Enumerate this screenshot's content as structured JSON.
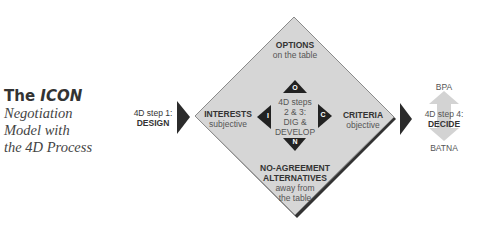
{
  "title": {
    "prefix": "The",
    "emphasis": "ICON",
    "subtitle_lines": [
      "Negotiation",
      "Model with",
      "the 4D Process"
    ]
  },
  "colors": {
    "diamond_fill": "#d6d6d6",
    "diamond_edge": "#8a8a8a",
    "diamond_shadow": "#333333",
    "arrow": "#2b2b2b",
    "decide_arrow": "#d0d0d0",
    "text": "#333333"
  },
  "step1": {
    "line1": "4D step 1:",
    "line2": "DESIGN"
  },
  "diamond": {
    "top": {
      "heading": "OPTIONS",
      "sub": "on the table"
    },
    "left": {
      "heading": "INTERESTS",
      "sub": "subjective"
    },
    "right": {
      "heading": "CRITERIA",
      "sub": "objective"
    },
    "bottom": {
      "heading1": "NO-AGREEMENT",
      "heading2": "ALTERNATIVES",
      "sub1": "away from",
      "sub2": "the table"
    },
    "center": {
      "line1": "4D steps",
      "line2": "2 & 3:",
      "line3": "DIG &",
      "line4": "DEVELOP"
    },
    "markers": {
      "top": "O",
      "left": "I",
      "right": "C",
      "bottom": "N"
    }
  },
  "step4": {
    "above": "BPA",
    "line1": "4D step 4:",
    "line2": "DECIDE",
    "below": "BATNA"
  }
}
